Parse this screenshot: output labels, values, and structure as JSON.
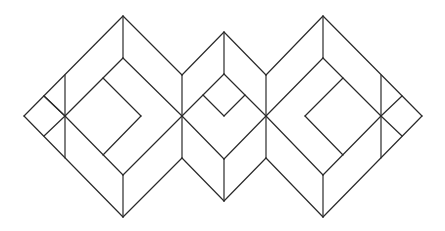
{
  "diagram": {
    "title": "",
    "stroke_color": "#2a2a2a",
    "background": "#ffffff",
    "segments": [
      [
        24,
        116,
        123,
        16
      ],
      [
        123,
        16,
        182,
        75
      ],
      [
        24,
        116,
        123,
        217
      ],
      [
        123,
        217,
        182,
        158
      ],
      [
        123,
        16,
        123,
        58
      ],
      [
        123,
        217,
        123,
        175
      ],
      [
        65,
        75,
        65,
        158
      ],
      [
        44,
        96,
        65,
        116
      ],
      [
        44,
        136,
        65,
        116
      ],
      [
        65,
        116,
        182,
        233
      ],
      [
        65,
        116,
        123,
        58
      ],
      [
        123,
        58,
        182,
        116
      ],
      [
        65,
        116,
        123,
        175
      ],
      [
        123,
        175,
        182,
        116
      ],
      [
        103,
        78,
        141,
        116
      ],
      [
        141,
        116,
        103,
        155
      ],
      [
        182,
        75,
        224,
        32
      ],
      [
        224,
        32,
        266,
        75
      ],
      [
        182,
        158,
        224,
        201
      ],
      [
        224,
        201,
        266,
        158
      ],
      [
        182,
        75,
        182,
        158
      ],
      [
        266,
        75,
        266,
        158
      ],
      [
        224,
        32,
        224,
        74
      ],
      [
        224,
        159,
        224,
        201
      ],
      [
        182,
        116,
        224,
        74
      ],
      [
        224,
        74,
        266,
        116
      ],
      [
        182,
        116,
        224,
        159
      ],
      [
        224,
        159,
        266,
        116
      ],
      [
        203,
        95,
        224,
        116
      ],
      [
        224,
        116,
        245,
        95
      ],
      [
        266,
        75,
        323,
        16
      ],
      [
        323,
        16,
        422,
        116
      ],
      [
        422,
        116,
        323,
        217
      ],
      [
        323,
        217,
        266,
        158
      ],
      [
        323,
        16,
        323,
        58
      ],
      [
        323,
        217,
        323,
        175
      ],
      [
        266,
        116,
        323,
        58
      ],
      [
        323,
        58,
        381,
        116
      ],
      [
        266,
        116,
        323,
        175
      ],
      [
        323,
        175,
        381,
        116
      ],
      [
        343,
        78,
        305,
        116
      ],
      [
        305,
        116,
        343,
        155
      ],
      [
        381,
        75,
        381,
        158
      ],
      [
        402,
        96,
        381,
        116
      ],
      [
        402,
        136,
        381,
        116
      ]
    ]
  }
}
